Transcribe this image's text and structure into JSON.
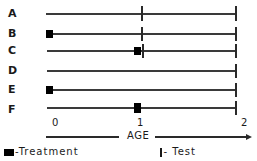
{
  "diagram": {
    "rows": [
      {
        "label": "A",
        "y": 14,
        "treatment_at": null,
        "test_ticks": [
          1,
          2
        ]
      },
      {
        "label": "B",
        "y": 34,
        "treatment_at": 0,
        "test_ticks": [
          1,
          2
        ]
      },
      {
        "label": "C",
        "y": 51,
        "treatment_at": 0.95,
        "test_ticks": [
          1,
          2
        ]
      },
      {
        "label": "D",
        "y": 71,
        "treatment_at": null,
        "test_ticks": [
          2
        ]
      },
      {
        "label": "E",
        "y": 90,
        "treatment_at": 0,
        "test_ticks": [
          2
        ]
      },
      {
        "label": "F",
        "y": 110,
        "treatment_at": 0.95,
        "test_ticks": [
          2
        ]
      }
    ],
    "axis": {
      "ticks": [
        "0",
        "1",
        "2"
      ],
      "label": "AGE",
      "range": [
        0,
        2
      ]
    },
    "legend": {
      "treatment": "-Treatment",
      "test": "- Test"
    },
    "colors": {
      "line": "#3a3a3a",
      "marker": "#000000",
      "background": "#ffffff"
    }
  }
}
